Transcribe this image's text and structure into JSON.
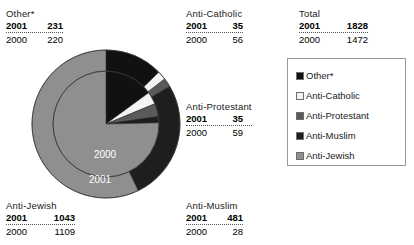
{
  "callouts": [
    {
      "key": "other",
      "category": "Other*",
      "current_year": "2001",
      "current_value": "231",
      "previous_year": "2000",
      "previous_value": "220"
    },
    {
      "key": "catholic",
      "category": "Anti-Catholic",
      "current_year": "2001",
      "current_value": "35",
      "previous_year": "2000",
      "previous_value": "56"
    },
    {
      "key": "total",
      "category": "Total",
      "current_year": "2001",
      "current_value": "1828",
      "previous_year": "2000",
      "previous_value": "1472"
    },
    {
      "key": "protestant",
      "category": "Anti-Protestant",
      "current_year": "2001",
      "current_value": "35",
      "previous_year": "2000",
      "previous_value": "59"
    },
    {
      "key": "jewish",
      "category": "Anti-Jewish",
      "current_year": "2001",
      "current_value": "1043",
      "previous_year": "2000",
      "previous_value": "1109"
    },
    {
      "key": "muslim",
      "category": "Anti-Muslim",
      "current_year": "2001",
      "current_value": "481",
      "previous_year": "2000",
      "previous_value": "28"
    }
  ],
  "ring_labels": {
    "outer": "2001",
    "inner": "2000"
  },
  "legend": {
    "items": [
      {
        "label": "Other*",
        "color": "#111111"
      },
      {
        "label": "Anti-Catholic",
        "color": "#f4f4f4"
      },
      {
        "label": "Anti-Protestant",
        "color": "#5a5a5a"
      },
      {
        "label": "Anti-Muslim",
        "color": "#1e1e1e"
      },
      {
        "label": "Anti-Jewish",
        "color": "#8f8f8f"
      }
    ]
  },
  "chart_data": {
    "type": "pie",
    "title": "",
    "subtitle": "",
    "xlabel": "",
    "ylabel": "",
    "grid": false,
    "legend_position": "right",
    "note": "Nested pie: outer ring = 2001, inner disc = 2000. Slices ordered clockwise from 12 o'clock.",
    "categories": [
      "Other*",
      "Anti-Catholic",
      "Anti-Protestant",
      "Anti-Muslim",
      "Anti-Jewish"
    ],
    "colors": [
      "#111111",
      "#f4f4f4",
      "#5a5a5a",
      "#1e1e1e",
      "#8f8f8f"
    ],
    "series": [
      {
        "name": "2001",
        "ring": "outer",
        "total": 1828,
        "values": [
          231,
          35,
          35,
          481,
          1043
        ],
        "percentages": [
          12.6,
          1.9,
          1.9,
          26.3,
          57.1
        ]
      },
      {
        "name": "2000",
        "ring": "inner",
        "total": 1472,
        "values": [
          220,
          56,
          59,
          28,
          1109
        ],
        "percentages": [
          14.9,
          3.8,
          4.0,
          1.9,
          75.3
        ]
      }
    ],
    "annotations": [
      "2001",
      "2000"
    ]
  },
  "geometry": {
    "cx": 75,
    "cy": 75,
    "outer_r": 74,
    "inner_r": 53,
    "start_angle_deg": -90
  }
}
